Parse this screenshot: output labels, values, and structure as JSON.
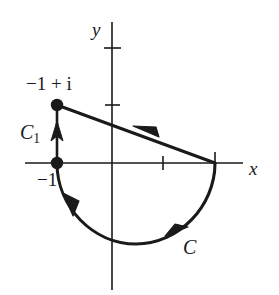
{
  "figure": {
    "width": 279,
    "height": 295,
    "background_color": "#ffffff",
    "ink_color": "#1a1a1a"
  },
  "axes": {
    "x_axis_label": "x",
    "y_axis_label": "y",
    "origin_px": {
      "x": 112,
      "y": 163
    },
    "x_axis_span_px": {
      "from": 25,
      "to": 243
    },
    "y_axis_span_px": {
      "from": 22,
      "to": 290
    },
    "x_ticks": [
      {
        "label": "",
        "px": 163,
        "value": 1
      },
      {
        "label": "",
        "px": 215,
        "value": 2
      }
    ],
    "y_ticks": [
      {
        "label": "",
        "px": 48,
        "value": 2
      },
      {
        "label": "",
        "px": 105,
        "value": 1
      }
    ]
  },
  "points": [
    {
      "name": "point-minus-one-plus-i",
      "label": "−1 + i",
      "px": {
        "x": 57,
        "y": 105
      },
      "radius_px": 6
    },
    {
      "name": "point-minus-one",
      "label": "−1",
      "px": {
        "x": 57,
        "y": 163
      },
      "radius_px": 6
    }
  ],
  "curves": {
    "segment_c1": {
      "label": "C",
      "label_subscript": "1",
      "from_px": {
        "x": 57,
        "y": 163
      },
      "to_px": {
        "x": 57,
        "y": 105
      },
      "direction": "upward",
      "arrow_px": {
        "x": 57,
        "y": 133
      }
    },
    "segment_diagonal": {
      "label": "",
      "from_px": {
        "x": 215,
        "y": 163
      },
      "to_px": {
        "x": 57,
        "y": 105
      },
      "direction": "leftward",
      "arrow_px": {
        "x": 141,
        "y": 132
      }
    },
    "arc_c": {
      "label": "C",
      "from_px": {
        "x": 57,
        "y": 163
      },
      "to_px": {
        "x": 215,
        "y": 163
      },
      "bottom_px": {
        "x": 136,
        "y": 244
      },
      "direction": "clockwise-from-left-through-bottom-to-right",
      "arrows_px": [
        {
          "x": 73,
          "y": 209
        },
        {
          "x": 180,
          "y": 233
        }
      ]
    }
  },
  "labels": {
    "minus_one_plus_i": "−1 + i",
    "minus_one": "−1",
    "c_one_base": "C",
    "c_one_sub": "1",
    "c": "C",
    "x": "x",
    "y": "y"
  }
}
